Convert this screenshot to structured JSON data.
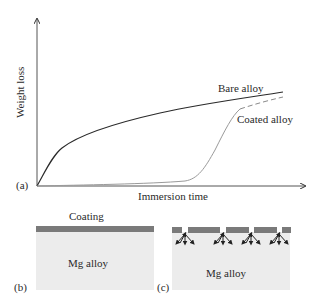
{
  "figure": {
    "panel_a": {
      "label": "(a)",
      "ylabel": "Weight loss",
      "xlabel": "Immersion time",
      "series": [
        {
          "name": "Bare alloy",
          "label": "Bare alloy",
          "color": "#2a2a2a",
          "style": "solid"
        },
        {
          "name": "Coated alloy",
          "label": "Coated alloy",
          "color": "#9a9a9a",
          "style": "solid-then-dashed"
        }
      ]
    },
    "panel_b": {
      "label": "(b)",
      "coating_label": "Coating",
      "substrate_label": "Mg alloy",
      "coating_color": "#7a7a7a",
      "substrate_color": "#ececec"
    },
    "panel_c": {
      "label": "(c)",
      "substrate_label": "Mg alloy",
      "coating_segments": 5,
      "corrosion_sites": 4
    }
  }
}
